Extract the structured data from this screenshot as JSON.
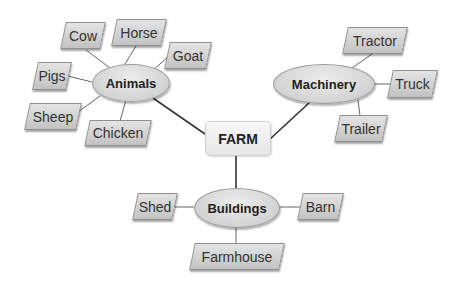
{
  "diagram": {
    "type": "mind-map",
    "root": {
      "label": "FARM"
    },
    "branches": [
      {
        "label": "Animals",
        "children": [
          "Cow",
          "Horse",
          "Goat",
          "Pigs",
          "Sheep",
          "Chicken"
        ]
      },
      {
        "label": "Machinery",
        "children": [
          "Tractor",
          "Truck",
          "Trailer"
        ]
      },
      {
        "label": "Buildings",
        "children": [
          "Shed",
          "Barn",
          "Farmhouse"
        ]
      }
    ]
  },
  "colors": {
    "background": "#ffffff",
    "node_fill": "#d4d4d4",
    "node_border": "#8f8f8f",
    "root_fill": "#eeeeee",
    "connector": "#333333",
    "text": "#222222"
  }
}
